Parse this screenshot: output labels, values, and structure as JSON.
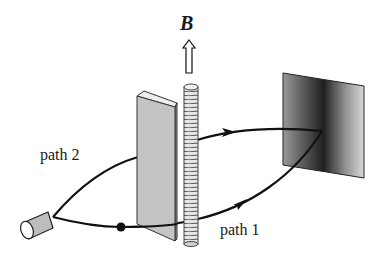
{
  "diagram": {
    "labels": {
      "field": "B",
      "path_upper": "path 2",
      "path_lower": "path 1"
    },
    "components": [
      {
        "id": "source",
        "label": "electron source (cylinder)"
      },
      {
        "id": "slab",
        "label": "barrier slab"
      },
      {
        "id": "solenoid",
        "label": "solenoid"
      },
      {
        "id": "field-arrow",
        "label": "magnetic field direction (up)"
      },
      {
        "id": "screen",
        "label": "detection screen with interference band"
      },
      {
        "id": "point",
        "label": "dot on path 1"
      }
    ],
    "colors": {
      "line": "#111111",
      "slab_fill": "#c8c8c8",
      "screen_dark": "#2a2a2a",
      "screen_light": "#d6d6d6",
      "source_fill": "#bdbdbd"
    }
  }
}
